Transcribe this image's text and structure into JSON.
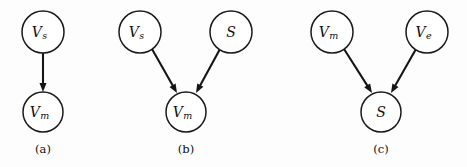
{
  "figure": {
    "width": 467,
    "height": 167,
    "background_color": "#fdfdfd",
    "stroke_color": "#151515",
    "node_fill_color": "#ffffff",
    "text_color": "#101010"
  },
  "panels": [
    {
      "caption": "(a)",
      "caption_x": 43,
      "caption_y": 150,
      "nodes": [
        {
          "id": "a_vs",
          "base": "V",
          "sub": "s",
          "cx": 43,
          "cy": 32,
          "r": 21
        },
        {
          "id": "a_vm",
          "base": "V",
          "sub": "m",
          "cx": 43,
          "cy": 112,
          "r": 20
        }
      ],
      "edges": [
        {
          "from": "a_vs",
          "to": "a_vm",
          "x1": 43,
          "y1": 53,
          "x2": 43,
          "y2": 92
        }
      ]
    },
    {
      "caption": "(b)",
      "caption_x": 186,
      "caption_y": 150,
      "nodes": [
        {
          "id": "b_vs",
          "base": "V",
          "sub": "s",
          "cx": 140,
          "cy": 32,
          "r": 21
        },
        {
          "id": "b_s",
          "base": "S",
          "sub": "",
          "cx": 231,
          "cy": 32,
          "r": 21
        },
        {
          "id": "b_vm",
          "base": "V",
          "sub": "m",
          "cx": 186,
          "cy": 112,
          "r": 20
        }
      ],
      "edges": [
        {
          "from": "b_vs",
          "to": "b_vm",
          "x1": 152,
          "y1": 49,
          "x2": 177,
          "y2": 93
        },
        {
          "from": "b_s",
          "to": "b_vm",
          "x1": 220,
          "y1": 49,
          "x2": 196,
          "y2": 93
        }
      ]
    },
    {
      "caption": "(c)",
      "caption_x": 381,
      "caption_y": 150,
      "nodes": [
        {
          "id": "c_vm",
          "base": "V",
          "sub": "m",
          "cx": 332,
          "cy": 32,
          "r": 21
        },
        {
          "id": "c_ve",
          "base": "V",
          "sub": "e",
          "cx": 427,
          "cy": 32,
          "r": 21
        },
        {
          "id": "c_s",
          "base": "S",
          "sub": "",
          "cx": 381,
          "cy": 112,
          "r": 20
        }
      ],
      "edges": [
        {
          "from": "c_vm",
          "to": "c_s",
          "x1": 344,
          "y1": 49,
          "x2": 372,
          "y2": 93
        },
        {
          "from": "c_ve",
          "to": "c_s",
          "x1": 416,
          "y1": 49,
          "x2": 391,
          "y2": 93
        }
      ]
    }
  ]
}
